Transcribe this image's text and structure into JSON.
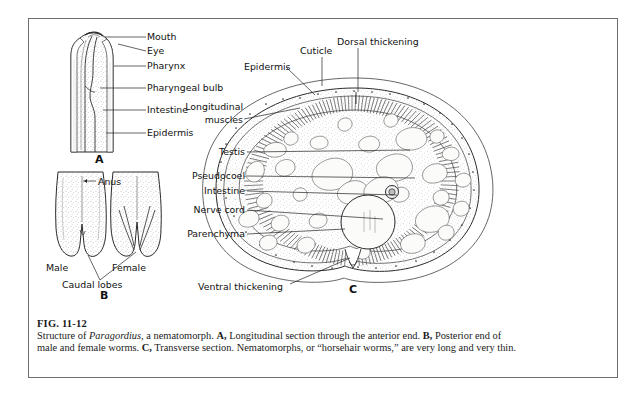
{
  "figure": {
    "number": "FIG. 11-12",
    "caption_parts": {
      "lead": "Structure of ",
      "genus": "Paragordius,",
      "after_genus": " a nematomorph. ",
      "a_tag": "A,",
      "a_text": " Longitudinal section through the anterior end. ",
      "b_tag": "B,",
      "b_text": " Posterior end of male and female worms. ",
      "c_tag": "C,",
      "c_text": " Transverse section. Nematomorphs, or “horsehair worms,” are very long and very thin."
    },
    "caption_plain": "Structure of Paragordius, a nematomorph. A, Longitudinal section through the anterior end. B, Posterior end of male and female worms. C, Transverse section. Nematomorphs, or “horsehair worms,” are very long and very thin."
  },
  "panels": [
    {
      "id": "A",
      "letter": "A",
      "title": "Longitudinal section through the anterior end"
    },
    {
      "id": "B",
      "letter": "B",
      "title": "Posterior end of male and female worms"
    },
    {
      "id": "C",
      "letter": "C",
      "title": "Transverse section"
    }
  ],
  "panel_a_labels": [
    {
      "text": "Mouth",
      "x": 147,
      "y": 40,
      "lx1": 146,
      "ly1": 37,
      "lx2": 105,
      "ly2": 37
    },
    {
      "text": "Eye",
      "x": 147,
      "y": 54,
      "lx1": 146,
      "ly1": 51,
      "lx2": 118,
      "ly2": 44
    },
    {
      "text": "Pharynx",
      "x": 147,
      "y": 69,
      "lx1": 146,
      "ly1": 66,
      "lx2": 114,
      "ly2": 66
    },
    {
      "text": "Pharyngeal bulb",
      "x": 147,
      "y": 91,
      "lx1": 146,
      "ly1": 88,
      "lx2": 100,
      "ly2": 88
    },
    {
      "text": "Intestine",
      "x": 147,
      "y": 113,
      "lx1": 146,
      "ly1": 110,
      "lx2": 103,
      "ly2": 110
    },
    {
      "text": "Epidermis",
      "x": 147,
      "y": 136,
      "lx1": 146,
      "ly1": 133,
      "lx2": 106,
      "ly2": 133
    }
  ],
  "panel_b_labels": [
    {
      "text": "Anus",
      "x": 98,
      "y": 183,
      "anchor": "start"
    },
    {
      "text": "Male",
      "x": 48,
      "y": 268,
      "anchor": "start"
    },
    {
      "text": "Female",
      "x": 113,
      "y": 268,
      "anchor": "start"
    },
    {
      "text": "Caudal lobes",
      "x": 62,
      "y": 283,
      "anchor": "start"
    }
  ],
  "panel_c_labels_left": [
    {
      "text": "Testis",
      "x": 245,
      "y": 155,
      "lx2": 410,
      "ly2": 150
    },
    {
      "text": "Pseudocoel",
      "x": 245,
      "y": 179,
      "lx2": 415,
      "ly2": 178
    },
    {
      "text": "Intestine",
      "x": 245,
      "y": 194,
      "lx2": 397,
      "ly2": 195
    },
    {
      "text": "Nerve cord",
      "x": 245,
      "y": 213,
      "lx2": 383,
      "ly2": 219
    },
    {
      "text": "Parenchyma",
      "x": 245,
      "y": 237,
      "lx2": 345,
      "ly2": 229
    }
  ],
  "panel_c_labels_other": [
    {
      "text": "Epidermis",
      "x": 244,
      "y": 70,
      "anchor": "start",
      "lx1": 286,
      "ly1": 67,
      "lx2": 315,
      "ly2": 95
    },
    {
      "text": "Cuticle",
      "x": 300,
      "y": 54,
      "anchor": "start",
      "lx1": 322,
      "ly1": 57,
      "lx2": 322,
      "ly2": 86
    },
    {
      "text": "Dorsal thickening",
      "x": 337,
      "y": 45,
      "anchor": "start",
      "lx1": 358,
      "ly1": 48,
      "lx2": 358,
      "ly2": 92
    },
    {
      "text": "Ventral thickening",
      "x": 198,
      "y": 287,
      "anchor": "start",
      "lx1": 290,
      "ly1": 284,
      "lx2": 350,
      "ly2": 258
    }
  ],
  "panel_c_label_longitudinal": {
    "line1": "Longitudinal",
    "line2": "muscles",
    "x": 243,
    "y1": 110,
    "y2": 123,
    "lx1": 244,
    "ly1": 119,
    "lx2": 300,
    "ly2": 108
  },
  "panel_letters": [
    {
      "text": "A",
      "x": 95,
      "y": 163
    },
    {
      "text": "B",
      "x": 100,
      "y": 299
    },
    {
      "text": "C",
      "x": 349,
      "y": 293
    }
  ],
  "colors": {
    "plate_border": "#6d6f72",
    "ink": "#2b2b2b",
    "leader": "#222222",
    "background": "#ffffff",
    "stipple": "#8d8d8d"
  }
}
